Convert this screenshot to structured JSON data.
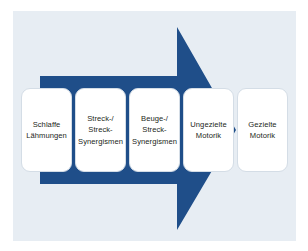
{
  "diagram": {
    "arrow_direction": "right",
    "arrow_color": "#1f4e89",
    "panel_background": "#e7edf3",
    "box_background": "#ffffff",
    "box_border_color": "#d4dde6",
    "text_color": "#231f20",
    "stages": [
      {
        "id": "stage-1",
        "label": "Schlaffe\nLähmungen"
      },
      {
        "id": "stage-2",
        "label": "Streck-/\nStreck-\nSynergismen"
      },
      {
        "id": "stage-3",
        "label": "Beuge-/\nStreck-\nSynergismen"
      },
      {
        "id": "stage-4",
        "label": "Ungezielte\nMotorik"
      },
      {
        "id": "stage-5",
        "label": "Gezielte\nMotorik"
      }
    ]
  }
}
